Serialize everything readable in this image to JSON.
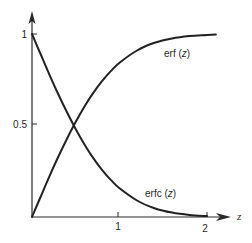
{
  "chart_data": {
    "type": "line",
    "title": "",
    "xlabel": "z",
    "ylabel": "",
    "xlim": [
      0,
      2.2
    ],
    "ylim": [
      0,
      1.1
    ],
    "grid": false,
    "legend": "inline labels",
    "x_ticks": [
      {
        "value": 1,
        "label": "1"
      },
      {
        "value": 2,
        "label": "2"
      }
    ],
    "y_ticks": [
      {
        "value": 0.5,
        "label": "0.5"
      },
      {
        "value": 1,
        "label": "1"
      }
    ],
    "x": [
      0,
      0.1,
      0.2,
      0.3,
      0.4,
      0.5,
      0.6,
      0.7,
      0.8,
      0.9,
      1.0,
      1.2,
      1.4,
      1.6,
      1.8,
      2.0
    ],
    "series": [
      {
        "name": "erf (z)",
        "label": "erf (z)",
        "values": [
          0,
          0.112,
          0.223,
          0.329,
          0.428,
          0.52,
          0.604,
          0.678,
          0.742,
          0.797,
          0.843,
          0.91,
          0.952,
          0.976,
          0.989,
          0.995
        ]
      },
      {
        "name": "erfc (z)",
        "label": "erfc (z)",
        "values": [
          1,
          0.888,
          0.777,
          0.671,
          0.572,
          0.48,
          0.396,
          0.322,
          0.258,
          0.203,
          0.157,
          0.09,
          0.048,
          0.024,
          0.011,
          0.005
        ]
      }
    ],
    "annotations": [
      {
        "text": "erf (z)",
        "near": "upper right of erf curve"
      },
      {
        "text": "erfc (z)",
        "near": "lower right of erfc curve"
      }
    ]
  },
  "labels": {
    "x_axis_var": "z",
    "x_tick_1": "1",
    "x_tick_2": "2",
    "y_tick_half": "0.5",
    "y_tick_one": "1",
    "erf_label_main": "erf (",
    "erf_label_var": "z",
    "erf_label_close": ")",
    "erfc_label_main": "erfc (",
    "erfc_label_var": "z",
    "erfc_label_close": ")"
  },
  "style": {
    "ink": "#222222",
    "axis": "#2a2a2a",
    "background": "#ffffff"
  }
}
